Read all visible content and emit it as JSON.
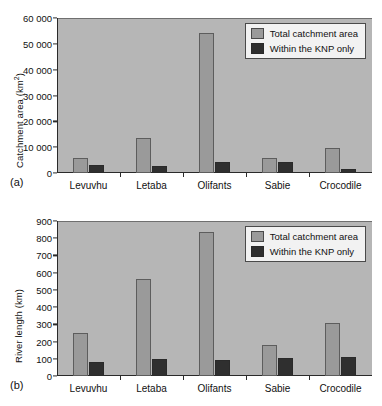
{
  "figure": {
    "background": "#ffffff",
    "panels": [
      {
        "tag": "(a)",
        "ylabel_main": "Catchment area (km",
        "ylabel_sup": "2",
        "ylabel_tail": ")"
      },
      {
        "tag": "(b)",
        "ylabel_main": "River length (km)",
        "ylabel_sup": "",
        "ylabel_tail": ""
      }
    ]
  },
  "colors": {
    "plot_background": "#b6b6b6",
    "total_bar": "#9a9a9a",
    "knp_bar": "#2f2f2f",
    "axis": "#2a2a2a",
    "legend_background": "#f2f2f2"
  },
  "legend": {
    "entries": [
      {
        "key": "total",
        "label": "Total catchment area"
      },
      {
        "key": "knp",
        "label": "Within the KNP only"
      }
    ]
  },
  "chart_data": [
    {
      "type": "bar",
      "panel": "(a)",
      "title": "",
      "xlabel": "",
      "ylabel": "Catchment area (km2)",
      "categories": [
        "Levuvhu",
        "Letaba",
        "Olifants",
        "Sabie",
        "Crocodile"
      ],
      "series": [
        {
          "name": "Total catchment area",
          "values": [
            5700,
            13700,
            54200,
            6000,
            9600
          ]
        },
        {
          "name": "Within the KNP only",
          "values": [
            3000,
            2800,
            4100,
            4200,
            1600
          ]
        }
      ],
      "ylim": [
        0,
        60000
      ],
      "yticks": [
        0,
        10000,
        20000,
        30000,
        40000,
        50000,
        60000
      ],
      "ytick_labels": [
        "0",
        "10 000",
        "20 000",
        "30 000",
        "40 000",
        "50 000",
        "60 000"
      ],
      "grid": false,
      "legend_position": "top-right"
    },
    {
      "type": "bar",
      "panel": "(b)",
      "title": "",
      "xlabel": "",
      "ylabel": "River length (km)",
      "categories": [
        "Levuvhu",
        "Letaba",
        "Olifants",
        "Sabie",
        "Crocodile"
      ],
      "series": [
        {
          "name": "Total catchment area",
          "values": [
            250,
            565,
            835,
            182,
            306
          ]
        },
        {
          "name": "Within the KNP only",
          "values": [
            82,
            98,
            93,
            105,
            108
          ]
        }
      ],
      "ylim": [
        0,
        900
      ],
      "yticks": [
        0,
        100,
        200,
        300,
        400,
        500,
        600,
        700,
        800,
        900
      ],
      "ytick_labels": [
        "0",
        "100",
        "200",
        "300",
        "400",
        "500",
        "600",
        "700",
        "800",
        "900"
      ],
      "grid": false,
      "legend_position": "top-right"
    }
  ]
}
